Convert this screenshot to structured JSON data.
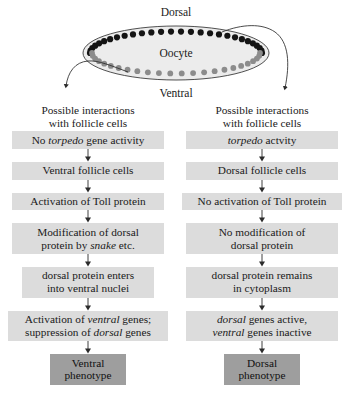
{
  "diagram": {
    "cell_label": "Oocyte",
    "dorsal_label": "Dorsal",
    "ventral_label": "Ventral",
    "colors": {
      "cell_fill": "#ececec",
      "cell_outline": "#3c3c3c",
      "dorsal_dot": "#141414",
      "ventral_dot": "#8c8c8c",
      "box_fill": "#dcdcdc",
      "phenotype_fill": "#9e9e9e",
      "arrow": "#2b2b2b"
    },
    "dorsal_dot_count": 28,
    "ventral_dot_count": 24
  },
  "headers": {
    "left": {
      "line1": "Possible interactions",
      "line2": "with follicle cells"
    },
    "right": {
      "line1": "Possible interactions",
      "line2": "with follicle cells"
    }
  },
  "left_column": {
    "steps": [
      {
        "id": "no-torpedo-gene-activity",
        "lines": [
          [
            {
              "t": "No ",
              "i": false
            },
            {
              "t": "torpedo",
              "i": true
            },
            {
              "t": " gene activity",
              "i": false
            }
          ]
        ],
        "width": "w-wide",
        "phenotype": false
      },
      {
        "id": "ventral-follicle-cells",
        "lines": [
          [
            {
              "t": "Ventral follicle cells",
              "i": false
            }
          ]
        ],
        "width": "w-wide",
        "phenotype": false
      },
      {
        "id": "activation-of-toll-protein",
        "lines": [
          [
            {
              "t": "Activation of Toll protein",
              "i": false
            }
          ]
        ],
        "width": "w-wide",
        "phenotype": false
      },
      {
        "id": "modification-of-dorsal-protein",
        "lines": [
          [
            {
              "t": "Modification of dorsal",
              "i": false
            }
          ],
          [
            {
              "t": "protein by ",
              "i": false
            },
            {
              "t": "snake",
              "i": true
            },
            {
              "t": " etc.",
              "i": false
            }
          ]
        ],
        "width": "w-wide",
        "phenotype": false
      },
      {
        "id": "dorsal-protein-enters-ventral-nuclei",
        "lines": [
          [
            {
              "t": "dorsal protein enters",
              "i": false
            }
          ],
          [
            {
              "t": "into ventral nuclei",
              "i": false
            }
          ]
        ],
        "width": "w-mid",
        "phenotype": false
      },
      {
        "id": "activation-ventral-suppression-dorsal",
        "lines": [
          [
            {
              "t": "Activation of ",
              "i": false
            },
            {
              "t": "ventral",
              "i": true
            },
            {
              "t": " genes;",
              "i": false
            }
          ],
          [
            {
              "t": "suppression of ",
              "i": false
            },
            {
              "t": "dorsal",
              "i": true
            },
            {
              "t": " genes",
              "i": false
            }
          ]
        ],
        "width": "w-full",
        "phenotype": false
      },
      {
        "id": "ventral-phenotype",
        "lines": [
          [
            {
              "t": "Ventral",
              "i": false
            }
          ],
          [
            {
              "t": "phenotype",
              "i": false
            }
          ]
        ],
        "width": "w-pheno",
        "phenotype": true
      }
    ]
  },
  "right_column": {
    "steps": [
      {
        "id": "torpedo-activity",
        "lines": [
          [
            {
              "t": "torpedo",
              "i": true
            },
            {
              "t": " actvity",
              "i": false
            }
          ]
        ],
        "width": "w-wide",
        "phenotype": false
      },
      {
        "id": "dorsal-follicle-cells",
        "lines": [
          [
            {
              "t": "Dorsal follicle cells",
              "i": false
            }
          ]
        ],
        "width": "w-wide",
        "phenotype": false
      },
      {
        "id": "no-activation-of-toll-protein",
        "lines": [
          [
            {
              "t": "No activation of Toll protein",
              "i": false
            }
          ]
        ],
        "width": "w-full",
        "phenotype": false
      },
      {
        "id": "no-modification-of-dorsal-protein",
        "lines": [
          [
            {
              "t": "No modification of",
              "i": false
            }
          ],
          [
            {
              "t": "dorsal protein",
              "i": false
            }
          ]
        ],
        "width": "w-wide",
        "phenotype": false
      },
      {
        "id": "dorsal-protein-remains-in-cytoplasm",
        "lines": [
          [
            {
              "t": "dorsal protein remains",
              "i": false
            }
          ],
          [
            {
              "t": "in cytoplasm",
              "i": false
            }
          ]
        ],
        "width": "w-wide",
        "phenotype": false
      },
      {
        "id": "dorsal-genes-active-ventral-inactive",
        "lines": [
          [
            {
              "t": "dorsal",
              "i": true
            },
            {
              "t": " genes active,",
              "i": false
            }
          ],
          [
            {
              "t": "ventral",
              "i": true
            },
            {
              "t": " genes inactive",
              "i": false
            }
          ]
        ],
        "width": "w-wide",
        "phenotype": false
      },
      {
        "id": "dorsal-phenotype",
        "lines": [
          [
            {
              "t": "Dorsal",
              "i": false
            }
          ],
          [
            {
              "t": "phenotype",
              "i": false
            }
          ]
        ],
        "width": "w-pheno",
        "phenotype": true
      }
    ]
  }
}
